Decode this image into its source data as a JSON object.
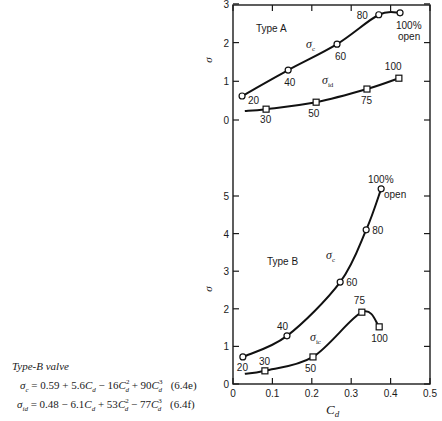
{
  "chart_data": [
    {
      "type": "line",
      "panel": "upper",
      "title": "Type A",
      "xlabel": "C_d",
      "ylabel": "σ",
      "xlim": [
        0,
        0.5
      ],
      "ylim": [
        0,
        3
      ],
      "yticks": [
        0,
        1,
        2,
        3
      ],
      "grid": false,
      "series": [
        {
          "name": "σ_c",
          "marker": "circle",
          "points": [
            {
              "x": 0.023,
              "y": 0.62,
              "label": "20"
            },
            {
              "x": 0.14,
              "y": 1.29,
              "label": "40"
            },
            {
              "x": 0.264,
              "y": 1.96,
              "label": "60"
            },
            {
              "x": 0.37,
              "y": 2.72,
              "label": "80"
            },
            {
              "x": 0.424,
              "y": 2.77,
              "label": "100% open"
            }
          ]
        },
        {
          "name": "σ_id",
          "marker": "square",
          "points": [
            {
              "x": 0.03,
              "y": 0.23,
              "label": ""
            },
            {
              "x": 0.084,
              "y": 0.28,
              "label": "30"
            },
            {
              "x": 0.211,
              "y": 0.46,
              "label": "50"
            },
            {
              "x": 0.34,
              "y": 0.8,
              "label": "75"
            },
            {
              "x": 0.421,
              "y": 1.08,
              "label": "100"
            }
          ]
        }
      ]
    },
    {
      "type": "line",
      "panel": "lower",
      "title": "Type B",
      "xlabel": "C_d",
      "ylabel": "σ",
      "xlim": [
        0,
        0.5
      ],
      "ylim": [
        0,
        5.5
      ],
      "xticks": [
        0,
        0.1,
        0.2,
        0.3,
        0.4,
        0.5
      ],
      "yticks": [
        0,
        1,
        2,
        3,
        4,
        5
      ],
      "grid": false,
      "series": [
        {
          "name": "σ_c",
          "marker": "circle",
          "points": [
            {
              "x": 0.025,
              "y": 0.72,
              "label": "20"
            },
            {
              "x": 0.137,
              "y": 1.28,
              "label": "40"
            },
            {
              "x": 0.272,
              "y": 2.71,
              "label": "60"
            },
            {
              "x": 0.338,
              "y": 4.1,
              "label": "80"
            },
            {
              "x": 0.376,
              "y": 5.19,
              "label": "100% open"
            }
          ]
        },
        {
          "name": "σ_ic",
          "marker": "square",
          "points": [
            {
              "x": 0.03,
              "y": 0.27,
              "label": ""
            },
            {
              "x": 0.081,
              "y": 0.35,
              "label": "30"
            },
            {
              "x": 0.203,
              "y": 0.72,
              "label": "50"
            },
            {
              "x": 0.327,
              "y": 1.91,
              "label": "75"
            },
            {
              "x": 0.371,
              "y": 1.52,
              "label": "100"
            }
          ]
        }
      ]
    }
  ],
  "labels": {
    "upper_title": "Type A",
    "lower_title": "Type B",
    "y_axis": "σ",
    "x_axis": "C",
    "x_axis_sub": "d",
    "upper_sigma_c": "σ",
    "upper_sigma_c_sub": "c",
    "upper_sigma_id": "σ",
    "upper_sigma_id_sub": "id",
    "lower_sigma_c": "σ",
    "lower_sigma_c_sub": "c",
    "lower_sigma_ic": "σ",
    "lower_sigma_ic_sub": "ic",
    "pct_open_1": "100%",
    "pct_open_2": "open"
  },
  "equations": {
    "title": "Type-B valve",
    "eq1": "σc = 0.59 + 5.6Cd − 16Cd² + 90Cd³",
    "eq1_num": "(6.4e)",
    "eq2": "σid = 0.48 − 6.1Cd + 53Cd² − 77Cd³",
    "eq2_num": "(6.4f)"
  }
}
